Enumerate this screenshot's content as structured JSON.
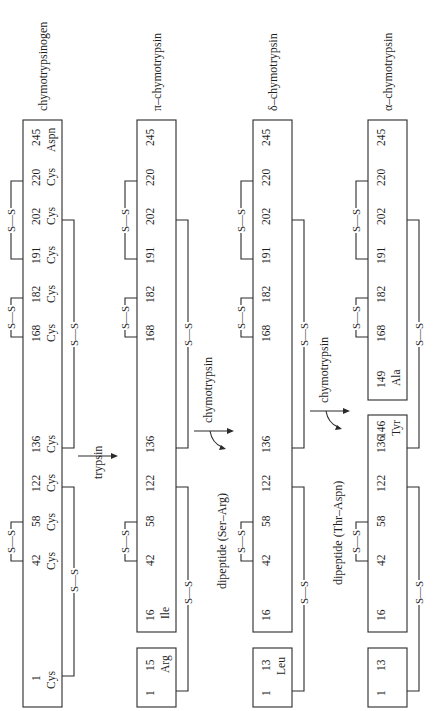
{
  "stages": [
    {
      "name": "chymotrypsinogen",
      "chains": [
        {
          "residues": [
            {
              "pos": "1",
              "aa": "Cys"
            },
            {
              "pos": "42",
              "aa": "Cys"
            },
            {
              "pos": "58",
              "aa": "Cys"
            },
            {
              "pos": "122",
              "aa": "Cys"
            },
            {
              "pos": "136",
              "aa": "Cys"
            },
            {
              "pos": "168",
              "aa": "Cys"
            },
            {
              "pos": "182",
              "aa": "Cys"
            },
            {
              "pos": "191",
              "aa": "Cys"
            },
            {
              "pos": "202",
              "aa": "Cys"
            },
            {
              "pos": "220",
              "aa": "Cys"
            },
            {
              "pos": "245",
              "aa": "Aspn"
            }
          ]
        }
      ]
    },
    {
      "name": "π–chymotrypsin",
      "chains": [
        {
          "residues": [
            {
              "pos": "1",
              "aa": ""
            },
            {
              "pos": "15",
              "aa": "Arg"
            }
          ]
        },
        {
          "residues": [
            {
              "pos": "16",
              "aa": "Ile"
            },
            {
              "pos": "42",
              "aa": ""
            },
            {
              "pos": "58",
              "aa": ""
            },
            {
              "pos": "122",
              "aa": ""
            },
            {
              "pos": "136",
              "aa": ""
            },
            {
              "pos": "168",
              "aa": ""
            },
            {
              "pos": "182",
              "aa": ""
            },
            {
              "pos": "191",
              "aa": ""
            },
            {
              "pos": "202",
              "aa": ""
            },
            {
              "pos": "220",
              "aa": ""
            },
            {
              "pos": "245",
              "aa": ""
            }
          ]
        }
      ]
    },
    {
      "name": "δ–chymotrypsin",
      "chains": [
        {
          "residues": [
            {
              "pos": "1",
              "aa": ""
            },
            {
              "pos": "13",
              "aa": "Leu"
            }
          ]
        },
        {
          "residues": [
            {
              "pos": "16",
              "aa": ""
            },
            {
              "pos": "42",
              "aa": ""
            },
            {
              "pos": "58",
              "aa": ""
            },
            {
              "pos": "122",
              "aa": ""
            },
            {
              "pos": "136",
              "aa": ""
            },
            {
              "pos": "168",
              "aa": ""
            },
            {
              "pos": "182",
              "aa": ""
            },
            {
              "pos": "191",
              "aa": ""
            },
            {
              "pos": "202",
              "aa": ""
            },
            {
              "pos": "220",
              "aa": ""
            },
            {
              "pos": "245",
              "aa": ""
            }
          ]
        }
      ]
    },
    {
      "name": "α–chymotrypsin",
      "chains": [
        {
          "residues": [
            {
              "pos": "1",
              "aa": ""
            },
            {
              "pos": "13",
              "aa": ""
            }
          ]
        },
        {
          "residues": [
            {
              "pos": "16",
              "aa": ""
            },
            {
              "pos": "42",
              "aa": ""
            },
            {
              "pos": "58",
              "aa": ""
            },
            {
              "pos": "122",
              "aa": ""
            },
            {
              "pos": "136",
              "aa": ""
            },
            {
              "pos": "146",
              "aa": "Tyr"
            }
          ]
        },
        {
          "residues": [
            {
              "pos": "149",
              "aa": "Ala"
            },
            {
              "pos": "168",
              "aa": ""
            },
            {
              "pos": "182",
              "aa": ""
            },
            {
              "pos": "191",
              "aa": ""
            },
            {
              "pos": "202",
              "aa": ""
            },
            {
              "pos": "220",
              "aa": ""
            },
            {
              "pos": "245",
              "aa": ""
            }
          ]
        }
      ]
    }
  ],
  "disulfide_label": "S—S",
  "steps": [
    {
      "enzyme": "trypsin",
      "released": ""
    },
    {
      "enzyme": "chymotrypsin",
      "released": "dipeptide (Ser–Arg)"
    },
    {
      "enzyme": "chymotrypsin",
      "released": "dipeptide (Thr–Aspn)"
    }
  ]
}
